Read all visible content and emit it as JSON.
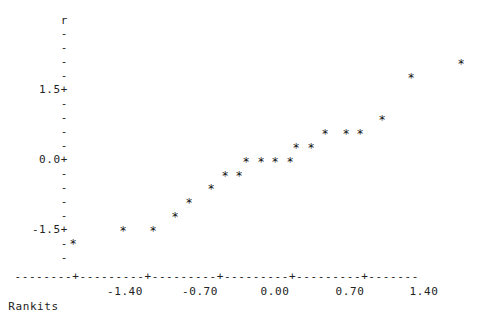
{
  "plot": {
    "style": "character-mode-scatterplot",
    "background_color": "#ffffff",
    "text_color": "#222222",
    "marker_glyph": "*",
    "axis_dash_glyph": "-",
    "axis_tick_glyph": "+",
    "y_tick_glyph": "-",
    "y_major_glyph": "+"
  },
  "yaxis": {
    "variable_label": "r",
    "major_labels": [
      "1.5+",
      "0.0+",
      "-1.5+"
    ],
    "minor_label": "-",
    "tick_rows": [
      {
        "text": "r",
        "y": 21,
        "major": false,
        "is_name": true
      },
      {
        "text": "-",
        "y": 34,
        "major": false
      },
      {
        "text": "-",
        "y": 48,
        "major": false
      },
      {
        "text": "-",
        "y": 62,
        "major": false
      },
      {
        "text": "-",
        "y": 76,
        "major": false
      },
      {
        "text": "1.5+",
        "y": 90,
        "major": true
      },
      {
        "text": "-",
        "y": 104,
        "major": false
      },
      {
        "text": "-",
        "y": 118,
        "major": false
      },
      {
        "text": "-",
        "y": 132,
        "major": false
      },
      {
        "text": "-",
        "y": 146,
        "major": false
      },
      {
        "text": "0.0+",
        "y": 160,
        "major": true
      },
      {
        "text": "-",
        "y": 174,
        "major": false
      },
      {
        "text": "-",
        "y": 188,
        "major": false
      },
      {
        "text": "-",
        "y": 202,
        "major": false
      },
      {
        "text": "-",
        "y": 216,
        "major": false
      },
      {
        "text": "-1.5+",
        "y": 230,
        "major": true
      },
      {
        "text": "-",
        "y": 244,
        "major": false
      },
      {
        "text": "-",
        "y": 258,
        "major": false
      }
    ]
  },
  "xaxis": {
    "title": "Rankits",
    "axis_line": "  --------+---------+---------+---------+---------+-------",
    "tick_labels": [
      {
        "text": "-1.40",
        "x": 125
      },
      {
        "text": "-0.70",
        "x": 200
      },
      {
        "text": "0.00",
        "x": 275
      },
      {
        "text": "0.70",
        "x": 350
      },
      {
        "text": "1.40",
        "x": 424
      }
    ],
    "tick_values": [
      -1.4,
      -0.7,
      0.0,
      0.7,
      1.4
    ],
    "tick_pixels": [
      125,
      200,
      275,
      350,
      424
    ]
  },
  "chart_data": {
    "type": "scatter",
    "title": "",
    "subtitle": "",
    "xlabel": "Rankits",
    "ylabel": "r",
    "grid": false,
    "legend": "none",
    "xlim": [
      -1.95,
      1.85
    ],
    "ylim": [
      -2.1,
      2.25
    ],
    "xticks": [
      -1.4,
      -0.7,
      0.0,
      0.7,
      1.4
    ],
    "yticks": [
      -1.5,
      0.0,
      1.5
    ],
    "marker": "*",
    "n_points": 22,
    "points": [
      {
        "x": -1.87,
        "y": -1.68,
        "px": 73,
        "py": 244
      },
      {
        "x": -1.4,
        "y": -1.5,
        "px": 123,
        "py": 231
      },
      {
        "x": -1.12,
        "y": -1.5,
        "px": 153,
        "py": 231
      },
      {
        "x": -0.91,
        "y": -1.35,
        "px": 175,
        "py": 217
      },
      {
        "x": -0.78,
        "y": -1.2,
        "px": 189,
        "py": 203
      },
      {
        "x": -0.57,
        "y": -1.05,
        "px": 211,
        "py": 189
      },
      {
        "x": -0.44,
        "y": -0.9,
        "px": 225,
        "py": 176
      },
      {
        "x": -0.31,
        "y": -0.9,
        "px": 239,
        "py": 176
      },
      {
        "x": -0.25,
        "y": -0.75,
        "px": 246,
        "py": 162
      },
      {
        "x": -0.12,
        "y": -0.75,
        "px": 261,
        "py": 162
      },
      {
        "x": 0.0,
        "y": -0.75,
        "px": 275,
        "py": 162
      },
      {
        "x": 0.14,
        "y": -0.75,
        "px": 290,
        "py": 162
      },
      {
        "x": 0.2,
        "y": -0.6,
        "px": 296,
        "py": 148
      },
      {
        "x": 0.34,
        "y": -0.6,
        "px": 311,
        "py": 148
      },
      {
        "x": 0.47,
        "y": -0.45,
        "px": 325,
        "py": 134
      },
      {
        "x": 0.67,
        "y": -0.45,
        "px": 346,
        "py": 134
      },
      {
        "x": 0.8,
        "y": -0.45,
        "px": 360,
        "py": 134
      },
      {
        "x": 1.0,
        "y": -0.3,
        "px": 382,
        "py": 120
      },
      {
        "x": 1.27,
        "y": 0.15,
        "px": 411,
        "py": 78
      },
      {
        "x": 1.74,
        "y": 0.3,
        "px": 461,
        "py": 64
      }
    ]
  }
}
